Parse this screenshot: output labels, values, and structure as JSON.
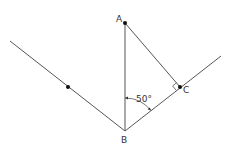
{
  "diagram": {
    "type": "geometry",
    "points": {
      "A": {
        "label": "A",
        "x": 125,
        "y": 23
      },
      "B": {
        "label": "B",
        "x": 125,
        "y": 131
      },
      "C": {
        "label": "C",
        "x": 180,
        "y": 87
      },
      "D": {
        "label": "",
        "x": 68,
        "y": 87
      }
    },
    "angle": {
      "label": "50°",
      "vertex": "B",
      "between": [
        "BA",
        "BC"
      ]
    },
    "right_angle_at": "C",
    "colors": {
      "line": "#555555",
      "point": "#111111",
      "text": "#333333",
      "background": "#ffffff"
    }
  }
}
